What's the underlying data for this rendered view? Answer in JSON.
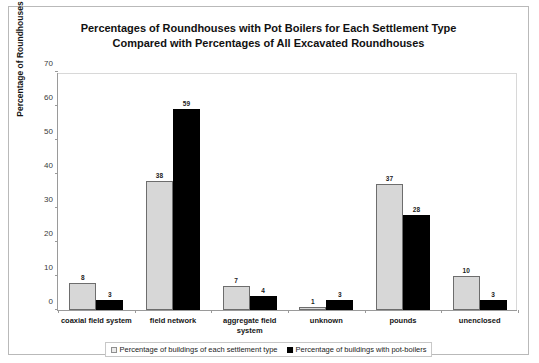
{
  "chart_data": {
    "type": "bar",
    "title": "Percentages of Roundhouses with Pot Boilers for Each Settlement Type Compared with Percentages of All Excavated Roundhouses",
    "title_lines": [
      "Percentages of Roundhouses with Pot Boilers for Each Settlement Type",
      "Compared with Percentages of All Excavated Roundhouses"
    ],
    "xlabel": "",
    "ylabel": "Percentage of Roundhouses",
    "ylim": [
      0,
      70
    ],
    "y_ticks": [
      0,
      10,
      20,
      30,
      40,
      50,
      60,
      70
    ],
    "grid": false,
    "legend_position": "bottom",
    "categories": [
      "coaxial field system",
      "field network",
      "aggregate field system",
      "unknown",
      "pounds",
      "unenclosed"
    ],
    "series": [
      {
        "name": "Percentage of buildings of each settlement type",
        "color": "#d7d7d7",
        "values": [
          8,
          38,
          7,
          1,
          37,
          10
        ]
      },
      {
        "name": "Percentage of buildings with pot-boilers",
        "color": "#000000",
        "values": [
          3,
          59,
          4,
          3,
          28,
          3
        ]
      }
    ]
  }
}
